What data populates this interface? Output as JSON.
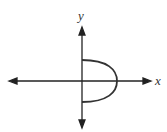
{
  "diagram": {
    "type": "coordinate-graph",
    "axes": {
      "x_label": "x",
      "y_label": "y"
    },
    "curve": {
      "description": "right half of an ellipse (semi-ellipse) opening to the right, from point on positive y-axis to point on negative y-axis",
      "color": "#333333"
    }
  }
}
